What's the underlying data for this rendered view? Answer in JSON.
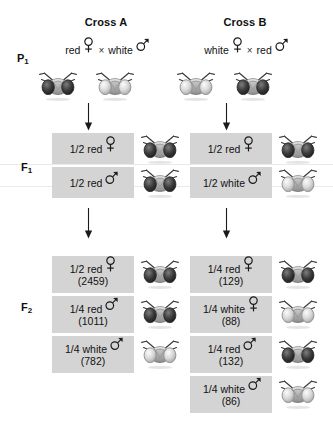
{
  "figure": {
    "columns": [
      {
        "title": "Cross A"
      },
      {
        "title": "Cross B"
      }
    ],
    "generations": {
      "p1_label": "P",
      "p1_sub": "1",
      "f1_label": "F",
      "f1_sub": "1",
      "f2_label": "F",
      "f2_sub": "2"
    },
    "symbols": {
      "female": "female-symbol",
      "male": "male-symbol",
      "cross": "×"
    },
    "crossA": {
      "title": "Cross A",
      "parents": {
        "mother_phenotype": "red",
        "mother_sex": "female",
        "cross_operator": "×",
        "father_phenotype": "white",
        "father_sex": "male"
      },
      "p1_flies": [
        {
          "eye": "red"
        },
        {
          "eye": "white"
        }
      ],
      "f1": [
        {
          "fraction": "1/2 red",
          "sex": "female",
          "count": "",
          "eye": "red"
        },
        {
          "fraction": "1/2 red",
          "sex": "male",
          "count": "",
          "eye": "red"
        }
      ],
      "f2": [
        {
          "fraction": "1/2 red",
          "sex": "female",
          "count": "(2459)",
          "eye": "red"
        },
        {
          "fraction": "1/4 red",
          "sex": "male",
          "count": "(1011)",
          "eye": "red"
        },
        {
          "fraction": "1/4 white",
          "sex": "male",
          "count": "(782)",
          "eye": "white"
        }
      ]
    },
    "crossB": {
      "title": "Cross B",
      "parents": {
        "mother_phenotype": "white",
        "mother_sex": "female",
        "cross_operator": "×",
        "father_phenotype": "red",
        "father_sex": "male"
      },
      "p1_flies": [
        {
          "eye": "white"
        },
        {
          "eye": "red"
        }
      ],
      "f1": [
        {
          "fraction": "1/2 red",
          "sex": "female",
          "count": "",
          "eye": "red"
        },
        {
          "fraction": "1/2 white",
          "sex": "male",
          "count": "",
          "eye": "white"
        }
      ],
      "f2": [
        {
          "fraction": "1/4 red",
          "sex": "female",
          "count": "(129)",
          "eye": "red"
        },
        {
          "fraction": "1/4 white",
          "sex": "female",
          "count": "(88)",
          "eye": "white"
        },
        {
          "fraction": "1/4 red",
          "sex": "male",
          "count": "(132)",
          "eye": "red"
        },
        {
          "fraction": "1/4 white",
          "sex": "male",
          "count": "(86)",
          "eye": "white"
        }
      ]
    },
    "colors": {
      "box_background": "#d4d4d4",
      "text": "#1a1a1a",
      "arrow": "#1a1a1a",
      "red_eye": "#3a3a3a",
      "white_eye": "#c8c8c8"
    }
  }
}
